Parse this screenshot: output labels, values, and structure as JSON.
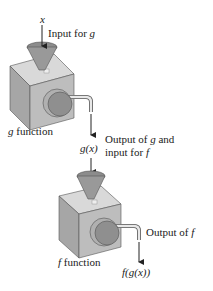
{
  "diagram": {
    "input_var": "x",
    "input_label_prefix": "Input for ",
    "input_label_var": "g",
    "g_machine": {
      "var": "g",
      "label": " function"
    },
    "middle_value": "g(x)",
    "middle_label_line1_prefix": "Output of ",
    "middle_label_line1_var": "g",
    "middle_label_line1_suffix": " and",
    "middle_label_line2_prefix": "input for ",
    "middle_label_line2_var": "f",
    "f_machine": {
      "var": "f",
      "label": " function"
    },
    "output_label_prefix": "Output of ",
    "output_label_var": "f",
    "final_value": "f(g(x))"
  },
  "colors": {
    "box_top": "#d9d9d9",
    "box_left": "#a6a6a6",
    "box_right": "#bdbdbd",
    "funnel": "#8c8c8c",
    "knob": "#8f8f8f",
    "knob_rim": "#b0b0b0",
    "arrow": "#222222"
  }
}
